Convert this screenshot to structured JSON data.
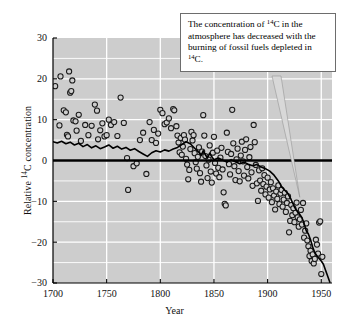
{
  "chart_data": {
    "type": "scatter",
    "title": "",
    "xlabel": "Year",
    "ylabel": "Relative ¹⁴C concentration",
    "xlim": [
      1700,
      1960
    ],
    "ylim": [
      -30,
      30
    ],
    "xticks": [
      1700,
      1750,
      1800,
      1850,
      1900,
      1950
    ],
    "yticks": [
      30,
      20,
      10,
      0,
      -10,
      -20,
      -30
    ],
    "xtick_labels": [
      "1700",
      "1750",
      "1800",
      "1850",
      "1900",
      "1950"
    ],
    "ytick_labels": [
      "30",
      "20",
      "10",
      "0",
      "−10",
      "−20",
      "−30"
    ],
    "minor_y_step": 5,
    "grid": "white gridlines on gray panel",
    "legend": "none",
    "zero_reference_line": 0,
    "series": [
      {
        "name": "Relative 14C concentration (tree-ring measurements)",
        "type": "scatter",
        "marker": "open circle",
        "points": [
          [
            1702,
            18.2
          ],
          [
            1707,
            20.6
          ],
          [
            1710,
            12.3
          ],
          [
            1712,
            11.8
          ],
          [
            1715,
            21.8
          ],
          [
            1716,
            16.6
          ],
          [
            1717,
            17.0
          ],
          [
            1718,
            19.6
          ],
          [
            1706,
            8.6
          ],
          [
            1713,
            6.3
          ],
          [
            1714,
            5.9
          ],
          [
            1719,
            9.8
          ],
          [
            1721,
            9.6
          ],
          [
            1722,
            7.3
          ],
          [
            1724,
            11.2
          ],
          [
            1726,
            4.8
          ],
          [
            1730,
            8.7
          ],
          [
            1733,
            6.2
          ],
          [
            1736,
            8.5
          ],
          [
            1739,
            13.7
          ],
          [
            1741,
            12.2
          ],
          [
            1742,
            5.2
          ],
          [
            1744,
            7.4
          ],
          [
            1746,
            9.1
          ],
          [
            1748,
            5.9
          ],
          [
            1750,
            6.2
          ],
          [
            1752,
            10.0
          ],
          [
            1754,
            8.7
          ],
          [
            1757,
            9.4
          ],
          [
            1760,
            6.0
          ],
          [
            1763,
            15.4
          ],
          [
            1766,
            9.2
          ],
          [
            1769,
            0.6
          ],
          [
            1770,
            -7.2
          ],
          [
            1775,
            -1.4
          ],
          [
            1778,
            -0.7
          ],
          [
            1781,
            5.0
          ],
          [
            1784,
            6.8
          ],
          [
            1787,
            -3.3
          ],
          [
            1790,
            9.4
          ],
          [
            1792,
            5.0
          ],
          [
            1794,
            7.5
          ],
          [
            1796,
            4.3
          ],
          [
            1798,
            6.6
          ],
          [
            1800,
            12.4
          ],
          [
            1802,
            11.6
          ],
          [
            1804,
            8.9
          ],
          [
            1806,
            9.3
          ],
          [
            1808,
            10.3
          ],
          [
            1810,
            7.9
          ],
          [
            1812,
            12.6
          ],
          [
            1813,
            12.3
          ],
          [
            1815,
            8.4
          ],
          [
            1816,
            6.1
          ],
          [
            1817,
            4.4
          ],
          [
            1818,
            2.0
          ],
          [
            1819,
            5.5
          ],
          [
            1820,
            1.4
          ],
          [
            1821,
            3.4
          ],
          [
            1822,
            6.2
          ],
          [
            1823,
            5.1
          ],
          [
            1824,
            0.4
          ],
          [
            1825,
            -1.0
          ],
          [
            1826,
            -4.6
          ],
          [
            1827,
            -2.3
          ],
          [
            1828,
            2.8
          ],
          [
            1829,
            7.0
          ],
          [
            1830,
            4.9
          ],
          [
            1831,
            6.2
          ],
          [
            1832,
            1.8
          ],
          [
            1833,
            -0.4
          ],
          [
            1834,
            -2.0
          ],
          [
            1835,
            0.9
          ],
          [
            1836,
            3.2
          ],
          [
            1837,
            -3.1
          ],
          [
            1838,
            -5.2
          ],
          [
            1839,
            2.2
          ],
          [
            1840,
            11.1
          ],
          [
            1841,
            6.1
          ],
          [
            1842,
            1.1
          ],
          [
            1843,
            -1.2
          ],
          [
            1844,
            -4.3
          ],
          [
            1845,
            0.2
          ],
          [
            1846,
            3.7
          ],
          [
            1847,
            -2.7
          ],
          [
            1848,
            -5.4
          ],
          [
            1849,
            1.9
          ],
          [
            1850,
            5.8
          ],
          [
            1851,
            -0.6
          ],
          [
            1852,
            -3.2
          ],
          [
            1853,
            2.4
          ],
          [
            1854,
            -1.8
          ],
          [
            1855,
            -4.1
          ],
          [
            1856,
            0.7
          ],
          [
            1857,
            3.1
          ],
          [
            1858,
            -2.2
          ],
          [
            1859,
            -7.8
          ],
          [
            1860,
            -10.6
          ],
          [
            1861,
            -11.0
          ],
          [
            1862,
            6.8
          ],
          [
            1863,
            2.1
          ],
          [
            1864,
            -0.9
          ],
          [
            1865,
            -3.4
          ],
          [
            1866,
            1.6
          ],
          [
            1867,
            12.4
          ],
          [
            1868,
            4.2
          ],
          [
            1869,
            -1.4
          ],
          [
            1870,
            -4.8
          ],
          [
            1871,
            0.3
          ],
          [
            1872,
            2.9
          ],
          [
            1873,
            -2.6
          ],
          [
            1874,
            -5.1
          ],
          [
            1875,
            1.2
          ],
          [
            1876,
            4.6
          ],
          [
            1877,
            -0.2
          ],
          [
            1878,
            -3.7
          ],
          [
            1879,
            2.6
          ],
          [
            1880,
            5.2
          ],
          [
            1881,
            -1.6
          ],
          [
            1882,
            -4.4
          ],
          [
            1883,
            0.8
          ],
          [
            1884,
            3.3
          ],
          [
            1885,
            -2.9
          ],
          [
            1886,
            -6.2
          ],
          [
            1887,
            8.7
          ],
          [
            1888,
            4.5
          ],
          [
            1889,
            -1.1
          ],
          [
            1890,
            -5.6
          ],
          [
            1891,
            -9.9
          ],
          [
            1892,
            -2.4
          ],
          [
            1893,
            -4.9
          ],
          [
            1894,
            -7.4
          ],
          [
            1895,
            -1.9
          ],
          [
            1896,
            -5.8
          ],
          [
            1897,
            -3.6
          ],
          [
            1898,
            -8.3
          ],
          [
            1899,
            -6.4
          ],
          [
            1900,
            -4.2
          ],
          [
            1901,
            -9.1
          ],
          [
            1902,
            -7.1
          ],
          [
            1903,
            -5.3
          ],
          [
            1904,
            -10.2
          ],
          [
            1905,
            -6.8
          ],
          [
            1906,
            -8.6
          ],
          [
            1907,
            -12.0
          ],
          [
            1908,
            -7.6
          ],
          [
            1909,
            -9.4
          ],
          [
            1910,
            -6.1
          ],
          [
            1911,
            -10.7
          ],
          [
            1912,
            -8.1
          ],
          [
            1913,
            -7.2
          ],
          [
            1914,
            -11.3
          ],
          [
            1915,
            -9.6
          ],
          [
            1916,
            -7.9
          ],
          [
            1917,
            -12.6
          ],
          [
            1918,
            -10.4
          ],
          [
            1919,
            -8.8
          ],
          [
            1920,
            -17.6
          ],
          [
            1921,
            -14.8
          ],
          [
            1922,
            -10.9
          ],
          [
            1923,
            -13.4
          ],
          [
            1924,
            -11.7
          ],
          [
            1925,
            -15.1
          ],
          [
            1926,
            -12.8
          ],
          [
            1927,
            -10.3
          ],
          [
            1928,
            -13.9
          ],
          [
            1929,
            -16.2
          ],
          [
            1930,
            -14.4
          ],
          [
            1931,
            -12.1
          ],
          [
            1932,
            -15.7
          ],
          [
            1933,
            -10.4
          ],
          [
            1934,
            -18.9
          ],
          [
            1935,
            -17.2
          ],
          [
            1936,
            -15.4
          ],
          [
            1937,
            -19.6
          ],
          [
            1938,
            -21.0
          ],
          [
            1939,
            -23.4
          ],
          [
            1940,
            -22.1
          ],
          [
            1941,
            -24.6
          ],
          [
            1942,
            -23.0
          ],
          [
            1943,
            -25.2
          ],
          [
            1944,
            -24.1
          ],
          [
            1945,
            -19.4
          ],
          [
            1946,
            -20.6
          ],
          [
            1947,
            -22.8
          ],
          [
            1948,
            -15.2
          ],
          [
            1949,
            -14.9
          ],
          [
            1950,
            -27.8
          ],
          [
            1951,
            -23.6
          ]
        ]
      },
      {
        "name": "Smoothed trend line",
        "type": "line",
        "points": [
          [
            1700,
            4.6
          ],
          [
            1704,
            4.3
          ],
          [
            1708,
            4.7
          ],
          [
            1712,
            4.1
          ],
          [
            1716,
            4.5
          ],
          [
            1720,
            3.8
          ],
          [
            1724,
            4.2
          ],
          [
            1728,
            3.4
          ],
          [
            1732,
            3.9
          ],
          [
            1736,
            3.1
          ],
          [
            1740,
            3.6
          ],
          [
            1744,
            2.9
          ],
          [
            1748,
            3.3
          ],
          [
            1752,
            3.8
          ],
          [
            1756,
            3.0
          ],
          [
            1760,
            3.5
          ],
          [
            1764,
            2.8
          ],
          [
            1768,
            3.2
          ],
          [
            1772,
            2.5
          ],
          [
            1776,
            2.9
          ],
          [
            1780,
            2.2
          ],
          [
            1784,
            1.6
          ],
          [
            1788,
            1.0
          ],
          [
            1792,
            1.9
          ],
          [
            1796,
            2.4
          ],
          [
            1800,
            2.1
          ],
          [
            1804,
            2.6
          ],
          [
            1808,
            2.3
          ],
          [
            1812,
            2.8
          ],
          [
            1816,
            3.2
          ],
          [
            1820,
            3.9
          ],
          [
            1824,
            4.6
          ],
          [
            1828,
            4.1
          ],
          [
            1832,
            3.0
          ],
          [
            1836,
            2.0
          ],
          [
            1838,
            1.2
          ],
          [
            1840,
            2.4
          ],
          [
            1842,
            1.4
          ],
          [
            1844,
            0.6
          ],
          [
            1846,
            1.8
          ],
          [
            1848,
            0.9
          ],
          [
            1850,
            0.2
          ],
          [
            1854,
            0.6
          ],
          [
            1858,
            0.1
          ],
          [
            1862,
            -0.4
          ],
          [
            1866,
            0.2
          ],
          [
            1870,
            -0.3
          ],
          [
            1874,
            -0.8
          ],
          [
            1878,
            -0.4
          ],
          [
            1882,
            -0.9
          ],
          [
            1886,
            -1.3
          ],
          [
            1890,
            -1.0
          ],
          [
            1894,
            -1.6
          ],
          [
            1898,
            -2.0
          ],
          [
            1902,
            -2.6
          ],
          [
            1906,
            -3.6
          ],
          [
            1910,
            -5.0
          ],
          [
            1913,
            -6.4
          ],
          [
            1916,
            -7.3
          ],
          [
            1919,
            -8.1
          ],
          [
            1922,
            -9.6
          ],
          [
            1925,
            -11.4
          ],
          [
            1928,
            -12.6
          ],
          [
            1930,
            -13.2
          ],
          [
            1932,
            -14.0
          ],
          [
            1934,
            -15.4
          ],
          [
            1936,
            -17.2
          ],
          [
            1938,
            -18.0
          ],
          [
            1940,
            -19.4
          ],
          [
            1942,
            -21.2
          ],
          [
            1944,
            -22.6
          ],
          [
            1946,
            -23.4
          ],
          [
            1948,
            -24.0
          ],
          [
            1950,
            -24.6
          ],
          [
            1952,
            -25.4
          ],
          [
            1955,
            -27.6
          ],
          [
            1958,
            -29.8
          ]
        ]
      }
    ],
    "annotation": {
      "text_line1": "The concentration of ",
      "sup1": "14",
      "text_line1b": "C in the",
      "text_line2": "atmosphere has decreased with",
      "text_line3": "the burning of fossil fuels",
      "text_line4": "depleted in ",
      "sup2": "14",
      "text_line4b": "C.",
      "points_to": [
        1930,
        -9
      ]
    }
  },
  "colors": {
    "panel_background": "#cdcdcd",
    "gridline": "#ffffff",
    "marker_edge": "#1a1a1a",
    "marker_fill": "#cdcdcd",
    "trend_line": "#000000",
    "zero_line": "#000000",
    "axis": "#000000",
    "callout_border": "#6d6d6d",
    "callout_background": "#ffffff",
    "text": "#111111"
  }
}
